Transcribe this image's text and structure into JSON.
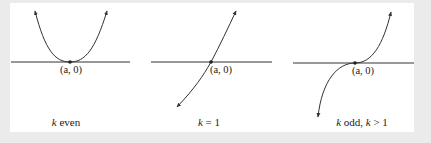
{
  "figure": {
    "background_color": "#ebebeb",
    "panel_color": "#ffffff",
    "stroke_color": "#333333",
    "panels": [
      {
        "id": "k-even",
        "point_label": "(a, 0)",
        "caption_var": "k",
        "caption_rest": " even",
        "curve": "parabola-touching-axis"
      },
      {
        "id": "k-one",
        "point_label": "(a, 0)",
        "caption_var": "k",
        "caption_rest": " = 1",
        "curve": "line-crossing-axis"
      },
      {
        "id": "k-odd-gt-1",
        "point_label": "(a, 0)",
        "caption_var": "k",
        "caption_rest": " odd, ",
        "caption_var2": "k",
        "caption_rest2": " > 1",
        "curve": "cubic-flattening-at-axis"
      }
    ]
  }
}
